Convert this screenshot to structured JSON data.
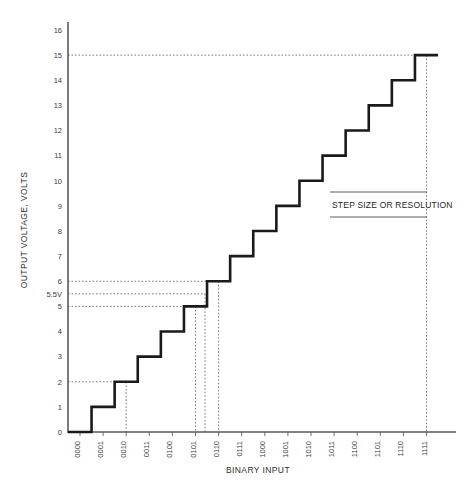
{
  "chart_data": {
    "type": "line",
    "title": "",
    "xlabel": "BINARY INPUT",
    "ylabel": "OUTPUT VOLTAGE, VOLTS",
    "categories": [
      "0000",
      "0001",
      "0010",
      "0011",
      "0100",
      "0101",
      "0110",
      "0111",
      "1000",
      "1001",
      "1010",
      "1011",
      "1100",
      "1101",
      "1110",
      "1111"
    ],
    "values": [
      0,
      1,
      2,
      3,
      4,
      5,
      6,
      7,
      8,
      9,
      10,
      11,
      12,
      13,
      14,
      15
    ],
    "series": [
      {
        "name": "DAC output staircase",
        "values": [
          0,
          1,
          2,
          3,
          4,
          5,
          6,
          7,
          8,
          9,
          10,
          11,
          12,
          13,
          14,
          15
        ]
      }
    ],
    "ylim": [
      0,
      16
    ],
    "yticks": [
      0,
      1,
      2,
      3,
      4,
      5,
      6,
      7,
      8,
      9,
      10,
      11,
      12,
      13,
      14,
      15,
      16
    ],
    "ytick_labels": [
      "0",
      "1",
      "2",
      "3",
      "4",
      "5",
      "6",
      "7",
      "8",
      "9",
      "10",
      "11",
      "12",
      "13",
      "14",
      "15",
      "16"
    ],
    "special_ytick": {
      "value": 5.5,
      "label": "5.5V"
    },
    "grid": false,
    "legend": false,
    "annotations": [
      {
        "text": "STEP SIZE OR RESOLUTION",
        "value_y": 9.0
      }
    ],
    "reference_lines": [
      {
        "axis": "y",
        "value": 15,
        "style": "dotted"
      },
      {
        "axis": "y",
        "value": 6,
        "style": "dotted"
      },
      {
        "axis": "y",
        "value": 5.5,
        "style": "dotted"
      },
      {
        "axis": "y",
        "value": 5,
        "style": "dotted"
      },
      {
        "axis": "y",
        "value": 2,
        "style": "dotted"
      },
      {
        "axis": "x",
        "category": "0010",
        "style": "dotted"
      },
      {
        "axis": "x",
        "category": "0101",
        "style": "dotted"
      },
      {
        "axis": "x",
        "category": "0110",
        "style": "dotted"
      },
      {
        "axis": "x",
        "category": "1111",
        "style": "dotted"
      }
    ]
  },
  "axes": {
    "y_title": "OUTPUT VOLTAGE, VOLTS",
    "x_title": "BINARY INPUT"
  },
  "annotation": {
    "step_size_label": "STEP SIZE OR RESOLUTION"
  },
  "colors": {
    "stair": "#1a1a1a",
    "axis": "#5a5a5a",
    "guide": "#6b6b6b",
    "text": "#2e2e2e",
    "background": "#ffffff"
  }
}
